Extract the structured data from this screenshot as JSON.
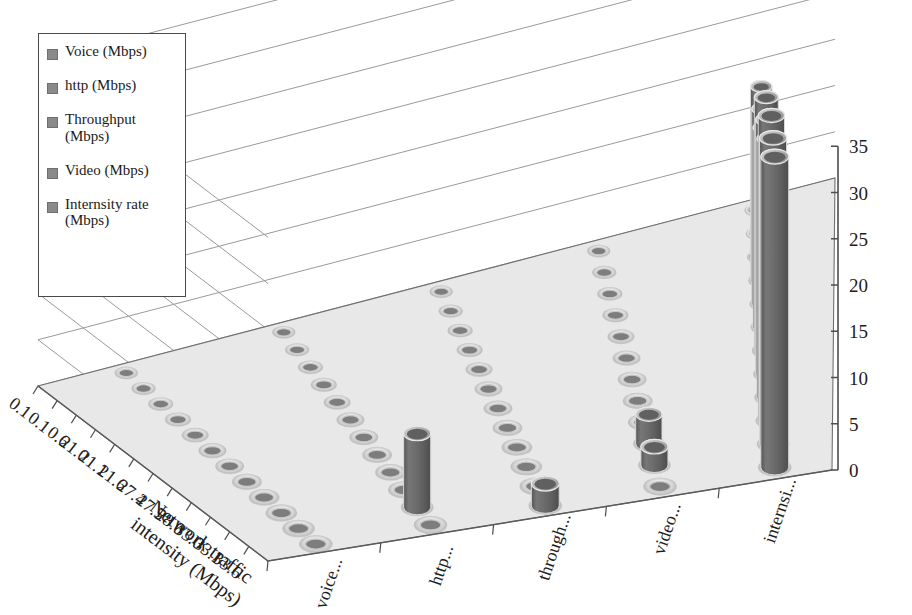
{
  "legend": {
    "items": [
      {
        "label": "Voice (Mbps)",
        "name": "legend-item-voice",
        "color": "#8a8a8a"
      },
      {
        "label": "http (Mbps)",
        "name": "legend-item-http",
        "color": "#8a8a8a"
      },
      {
        "label": "Throughput\n(Mbps)",
        "name": "legend-item-throughput",
        "color": "#8a8a8a"
      },
      {
        "label": "Video (Mbps)",
        "name": "legend-item-video",
        "color": "#8a8a8a"
      },
      {
        "label": "Internsity rate\n(Mbps)",
        "name": "legend-item-intensity-rate",
        "color": "#8a8a8a"
      }
    ]
  },
  "chart_data": {
    "type": "bar",
    "title": "",
    "xlabel": "Network traffic intensity (Mbps)",
    "ylabel": "",
    "zlabel": "",
    "ylim": [
      0,
      35
    ],
    "ytick_step": 5,
    "yticks": [
      "0",
      "5",
      "10",
      "15",
      "20",
      "25",
      "30",
      "35"
    ],
    "grid": true,
    "legend_position": "top-left",
    "categories": [
      "0.1",
      "0.1",
      "0.6",
      "21.0",
      "21.1",
      "21.6",
      "27.4",
      "27.5",
      "28.0",
      "33.0",
      "33.1",
      "33.6"
    ],
    "series_axis_labels": [
      "voice...",
      "http...",
      "through...",
      "video...",
      "internsi..."
    ],
    "series": [
      {
        "name": "Voice (Mbps)",
        "values": [
          0,
          0,
          0,
          0,
          0,
          0,
          0,
          0,
          0,
          0,
          0,
          0
        ]
      },
      {
        "name": "http (Mbps)",
        "values": [
          0,
          0,
          0,
          0,
          0,
          0,
          0,
          0,
          0,
          0,
          0,
          0
        ]
      },
      {
        "name": "Throughput (Mbps)",
        "values": [
          0,
          0,
          0,
          0,
          0,
          0,
          0,
          0,
          0,
          0,
          0,
          0
        ]
      },
      {
        "name": "Video (Mbps)",
        "values": [
          0,
          0,
          0,
          0,
          0,
          0,
          0,
          0,
          0,
          0,
          0,
          0
        ]
      },
      {
        "name": "Internsity rate (Mbps)",
        "values": [
          0.1,
          0.1,
          0.6,
          21.0,
          21.1,
          21.6,
          27.4,
          27.5,
          28.0,
          33.0,
          33.1,
          33.6
        ]
      }
    ],
    "extra_bars": [
      {
        "series": "Video (Mbps)",
        "category": "33.0",
        "value": 3.2
      },
      {
        "series": "Video (Mbps)",
        "category": "33.1",
        "value": 2.0
      },
      {
        "series": "Throughput (Mbps)",
        "category": "33.6",
        "value": 2.4
      },
      {
        "series": "http (Mbps)",
        "category": "33.1",
        "value": 8.0
      }
    ],
    "bar_color": "#6b6b6b",
    "bar_top_color": "#b9b9b9",
    "floor_color": "#e8e8e8",
    "grid_color": "#9a9a9a"
  },
  "axis_title": {
    "line1": "Network traffic",
    "line2": "intensity (Mbps)"
  }
}
